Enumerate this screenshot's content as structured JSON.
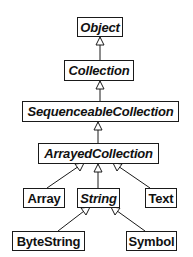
{
  "diagram": {
    "type": "class-hierarchy",
    "notation": "abstract classes shown in italics; hollow triangle arrows point to superclass",
    "nodes": [
      {
        "id": "object",
        "label": "Object",
        "abstract": true
      },
      {
        "id": "collection",
        "label": "Collection",
        "abstract": true
      },
      {
        "id": "sequenceable",
        "label": "SequenceableCollection",
        "abstract": true
      },
      {
        "id": "arrayed",
        "label": "ArrayedCollection",
        "abstract": true
      },
      {
        "id": "array",
        "label": "Array",
        "abstract": false
      },
      {
        "id": "string",
        "label": "String",
        "abstract": true
      },
      {
        "id": "text",
        "label": "Text",
        "abstract": false
      },
      {
        "id": "bytestring",
        "label": "ByteString",
        "abstract": false
      },
      {
        "id": "symbol",
        "label": "Symbol",
        "abstract": false
      }
    ],
    "edges": [
      {
        "from": "collection",
        "to": "object"
      },
      {
        "from": "sequenceable",
        "to": "collection"
      },
      {
        "from": "arrayed",
        "to": "sequenceable"
      },
      {
        "from": "array",
        "to": "arrayed"
      },
      {
        "from": "string",
        "to": "arrayed"
      },
      {
        "from": "text",
        "to": "arrayed"
      },
      {
        "from": "bytestring",
        "to": "string"
      },
      {
        "from": "symbol",
        "to": "string"
      }
    ]
  },
  "colors": {
    "line": "#1a1a1a",
    "background": "#ffffff"
  }
}
